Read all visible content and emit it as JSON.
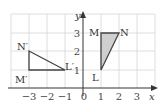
{
  "axes": {
    "x_label": "x",
    "y_label": "y"
  },
  "x_ticks": [
    {
      "label": "−3",
      "x": 29
    },
    {
      "label": "−2",
      "x": 47
    },
    {
      "label": "−1",
      "x": 65
    },
    {
      "label": "0",
      "x": 83
    },
    {
      "label": "1",
      "x": 101
    },
    {
      "label": "2",
      "x": 119
    },
    {
      "label": "3",
      "x": 137
    }
  ],
  "y_ticks": [
    {
      "label": "1",
      "y": 70
    },
    {
      "label": "2",
      "y": 52
    },
    {
      "label": "3",
      "y": 34
    }
  ],
  "triangle_LMN": {
    "fill": "#cfcfcf",
    "stroke": "#444444",
    "vertices": {
      "L": [
        1,
        1
      ],
      "M": [
        1,
        3
      ],
      "N": [
        2,
        3
      ]
    },
    "labels": {
      "L": "L",
      "M": "M",
      "N": "N"
    }
  },
  "triangle_image": {
    "stroke": "#444444",
    "vertices": {
      "L'": [
        -1,
        1
      ],
      "M'": [
        -3,
        1
      ],
      "N'": [
        -3,
        2
      ]
    },
    "labels": {
      "L": "L′",
      "M": "M′",
      "N": "N′"
    }
  }
}
